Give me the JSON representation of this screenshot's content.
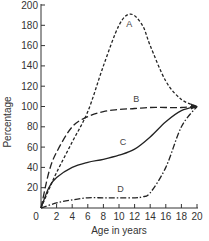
{
  "chart_data": {
    "type": "line",
    "title": "",
    "xlabel": "Age in years",
    "ylabel": "Percentage",
    "xlim": [
      0,
      20
    ],
    "ylim": [
      0,
      200
    ],
    "x_ticks": [
      0,
      2,
      4,
      6,
      8,
      10,
      12,
      14,
      16,
      18,
      20
    ],
    "y_ticks": [
      20,
      40,
      60,
      80,
      100,
      120,
      140,
      160,
      180,
      200
    ],
    "x_tick_labels": [
      "0",
      "2",
      "4",
      "6",
      "8",
      "10",
      "12",
      "14",
      "16",
      "18",
      "20"
    ],
    "y_tick_labels": [
      "20",
      "40",
      "60",
      "80",
      "100",
      "120",
      "140",
      "160",
      "180",
      "200"
    ],
    "grid": false,
    "legend": "inline labels on curves",
    "series": [
      {
        "name": "A",
        "style": "short-dashed",
        "x": [
          0,
          1,
          2,
          4,
          6,
          8,
          10,
          11.5,
          13,
          14,
          16,
          18,
          20
        ],
        "y": [
          0,
          18,
          35,
          65,
          95,
          140,
          180,
          191,
          180,
          160,
          125,
          107,
          100
        ]
      },
      {
        "name": "B",
        "style": "long-dashed",
        "x": [
          0,
          1,
          2,
          4,
          6,
          8,
          10,
          12,
          14,
          16,
          18,
          20
        ],
        "y": [
          0,
          35,
          55,
          80,
          90,
          95,
          97,
          98,
          99,
          99,
          99,
          100
        ]
      },
      {
        "name": "C",
        "style": "solid",
        "x": [
          0,
          1,
          2,
          4,
          6,
          8,
          10,
          12,
          14,
          16,
          18,
          20
        ],
        "y": [
          0,
          20,
          30,
          40,
          45,
          48,
          52,
          58,
          70,
          85,
          96,
          100
        ]
      },
      {
        "name": "D",
        "style": "dash-dot",
        "x": [
          0,
          2,
          4,
          6,
          8,
          10,
          12,
          13,
          14,
          16,
          18,
          20
        ],
        "y": [
          0,
          5,
          8,
          10,
          10,
          10,
          10,
          11,
          15,
          40,
          80,
          100
        ]
      }
    ],
    "annotations": [
      {
        "text": "A",
        "x": 11.3,
        "y": 178
      },
      {
        "text": "B",
        "x": 12.2,
        "y": 104
      },
      {
        "text": "C",
        "x": 10.5,
        "y": 62
      },
      {
        "text": "D",
        "x": 10.2,
        "y": 16
      }
    ]
  },
  "labels": {
    "xlabel": "Age in years",
    "ylabel": "Percentage"
  }
}
